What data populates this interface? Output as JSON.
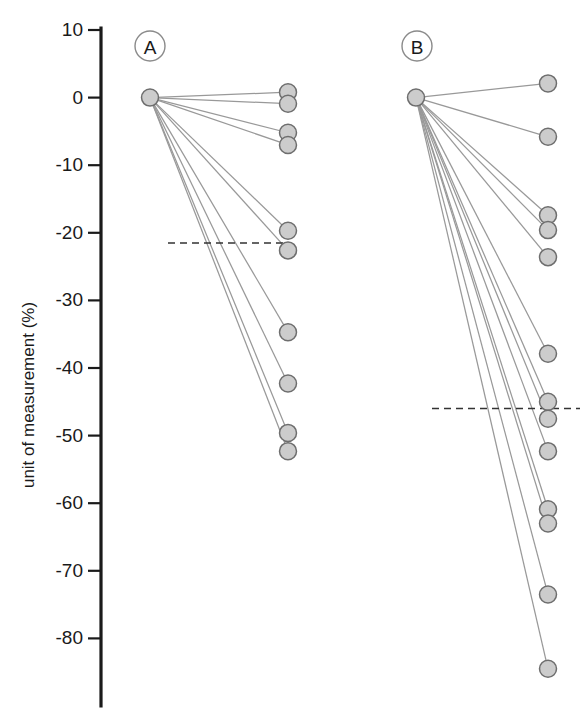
{
  "chart_data": {
    "type": "line",
    "subtype": "paired-slope-chart",
    "title": "",
    "xlabel": "",
    "ylabel": "unit of measurement (%)",
    "ylim": [
      -90,
      10
    ],
    "yticks": [
      10,
      0,
      -10,
      -20,
      -30,
      -40,
      -50,
      -60,
      -70,
      -80
    ],
    "ytick_labels": [
      "10",
      "0",
      "-10",
      "-20",
      "-30",
      "-40",
      "-50",
      "-60",
      "-70",
      "-80"
    ],
    "grid": false,
    "legend": "none",
    "x": [
      "baseline",
      "follow-up"
    ],
    "panels": [
      {
        "label": "A",
        "baseline_value": 0,
        "mean_line_value": -21.5,
        "mean_line_label": "",
        "series": [
          {
            "name": "subject-1",
            "values": [
              0,
              0.8
            ]
          },
          {
            "name": "subject-2",
            "values": [
              0,
              -0.9
            ]
          },
          {
            "name": "subject-3",
            "values": [
              0,
              -5.2
            ]
          },
          {
            "name": "subject-4",
            "values": [
              0,
              -7.0
            ]
          },
          {
            "name": "subject-5",
            "values": [
              0,
              -19.7
            ]
          },
          {
            "name": "subject-6",
            "values": [
              0,
              -22.6
            ]
          },
          {
            "name": "subject-7",
            "values": [
              0,
              -34.7
            ]
          },
          {
            "name": "subject-8",
            "values": [
              0,
              -42.3
            ]
          },
          {
            "name": "subject-9",
            "values": [
              0,
              -49.6
            ]
          },
          {
            "name": "subject-10",
            "values": [
              0,
              -52.3
            ]
          }
        ]
      },
      {
        "label": "B",
        "baseline_value": 0,
        "mean_line_value": -46.0,
        "mean_line_label": "",
        "series": [
          {
            "name": "subject-1",
            "values": [
              0,
              2.1
            ]
          },
          {
            "name": "subject-2",
            "values": [
              0,
              -5.8
            ]
          },
          {
            "name": "subject-3",
            "values": [
              0,
              -17.4
            ]
          },
          {
            "name": "subject-4",
            "values": [
              0,
              -19.6
            ]
          },
          {
            "name": "subject-5",
            "values": [
              0,
              -23.6
            ]
          },
          {
            "name": "subject-6",
            "values": [
              0,
              -37.9
            ]
          },
          {
            "name": "subject-7",
            "values": [
              0,
              -45.0
            ]
          },
          {
            "name": "subject-8",
            "values": [
              0,
              -47.5
            ]
          },
          {
            "name": "subject-9",
            "values": [
              0,
              -52.3
            ]
          },
          {
            "name": "subject-10",
            "values": [
              0,
              -60.9
            ]
          },
          {
            "name": "subject-11",
            "values": [
              0,
              -63.0
            ]
          },
          {
            "name": "subject-12",
            "values": [
              0,
              -73.5
            ]
          },
          {
            "name": "subject-13",
            "values": [
              0,
              -84.5
            ]
          }
        ]
      }
    ],
    "colors": {
      "marker_fill": "#cccccc",
      "marker_stroke": "#6e6e6e",
      "line": "#999999",
      "axis": "#1a1a1a",
      "mean_line": "#333333",
      "background": "#ffffff"
    }
  }
}
